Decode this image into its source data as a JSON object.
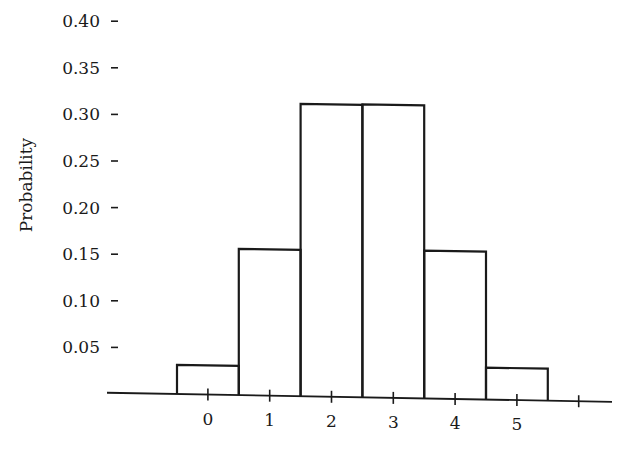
{
  "chart_data": {
    "type": "bar",
    "title": "",
    "xlabel": "",
    "ylabel": "Probability",
    "categories": [
      "0",
      "1",
      "2",
      "3",
      "4",
      "5"
    ],
    "values": [
      0.03125,
      0.15625,
      0.3125,
      0.3125,
      0.15625,
      0.03125
    ],
    "ylim": [
      0,
      0.4
    ],
    "yticks": [
      "0.05",
      "0.10",
      "0.15",
      "0.20",
      "0.25",
      "0.30",
      "0.35",
      "0.40"
    ],
    "xticks": [
      "0",
      "1",
      "2",
      "3",
      "4",
      "5",
      ""
    ],
    "grid": false,
    "legend": null,
    "style": "histogram-outline"
  }
}
